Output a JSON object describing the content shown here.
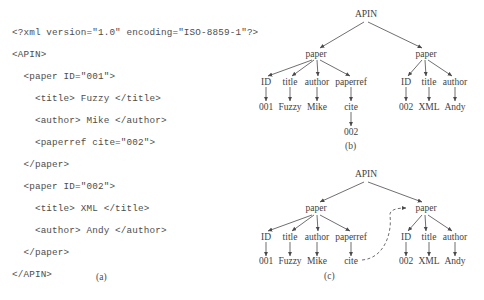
{
  "figure": {
    "panels": [
      {
        "id": "a",
        "caption": "(a)",
        "type": "xml-listing",
        "code_lines": [
          "<?xml version=\"1.0\" encoding=\"ISO-8859-1\"?>",
          "<APIN>",
          "  <paper ID=\"001\">",
          "    <title> Fuzzy </title>",
          "    <author> Mike </author>",
          "    <paperref cite=\"002\">",
          "  </paper>",
          "  <paper ID=\"002\">",
          "    <title> XML </title>",
          "    <author> Andy </author>",
          "  </paper>",
          "</APIN>"
        ]
      },
      {
        "id": "b",
        "caption": "(b)",
        "type": "tree",
        "nodes": {
          "root": "APIN",
          "paper_left": "paper",
          "paper_right": "paper",
          "left_children": [
            "ID",
            "title",
            "author",
            "paperref"
          ],
          "left_leaves": [
            "001",
            "Fuzzy",
            "Mike",
            "cite"
          ],
          "cite_child": "002",
          "right_children": [
            "ID",
            "title",
            "author"
          ],
          "right_leaves": [
            "002",
            "XML",
            "Andy"
          ]
        }
      },
      {
        "id": "c",
        "caption": "(c)",
        "type": "tree",
        "nodes": {
          "root": "APIN",
          "paper_left": "paper",
          "paper_right": "paper",
          "left_children": [
            "ID",
            "title",
            "author",
            "paperref"
          ],
          "left_leaves": [
            "001",
            "Fuzzy",
            "Mike",
            "cite"
          ],
          "right_children": [
            "ID",
            "title",
            "author"
          ],
          "right_leaves": [
            "002",
            "XML",
            "Andy"
          ]
        },
        "reference_edge": {
          "style": "dashed-curve",
          "from": "cite",
          "to": "paper_right"
        }
      }
    ],
    "colors": {
      "text": "#3f3f3f",
      "code_text": "#4d4d4d",
      "edge": "#4a4a4a",
      "background": "#ffffff"
    }
  }
}
